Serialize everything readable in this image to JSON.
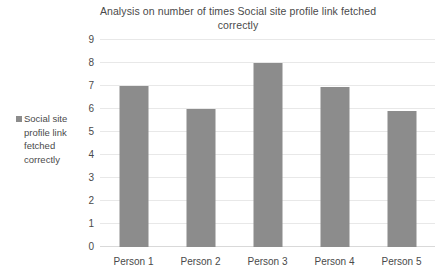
{
  "chart_data": {
    "type": "bar",
    "title": "Analysis on number of times Social site profile link fetched correctly",
    "xlabel": "",
    "ylabel": "",
    "categories": [
      "Person 1",
      "Person 2",
      "Person 3",
      "Person 4",
      "Person 5"
    ],
    "series": [
      {
        "name": "Social site profile link fetched correctly",
        "values": [
          7,
          6,
          8,
          6.95,
          5.9
        ]
      }
    ],
    "ylim": [
      0,
      9
    ],
    "yticks": [
      0,
      1,
      2,
      3,
      4,
      5,
      6,
      7,
      8,
      9
    ],
    "grid": "horizontal",
    "legend_position": "left",
    "bar_color": "#8c8c8c",
    "gridline_color": "#e8e8e8",
    "background_color": "#ffffff"
  },
  "legend": {
    "marker_name": "legend-color-swatch",
    "label": "Social site profile link fetched correctly"
  }
}
